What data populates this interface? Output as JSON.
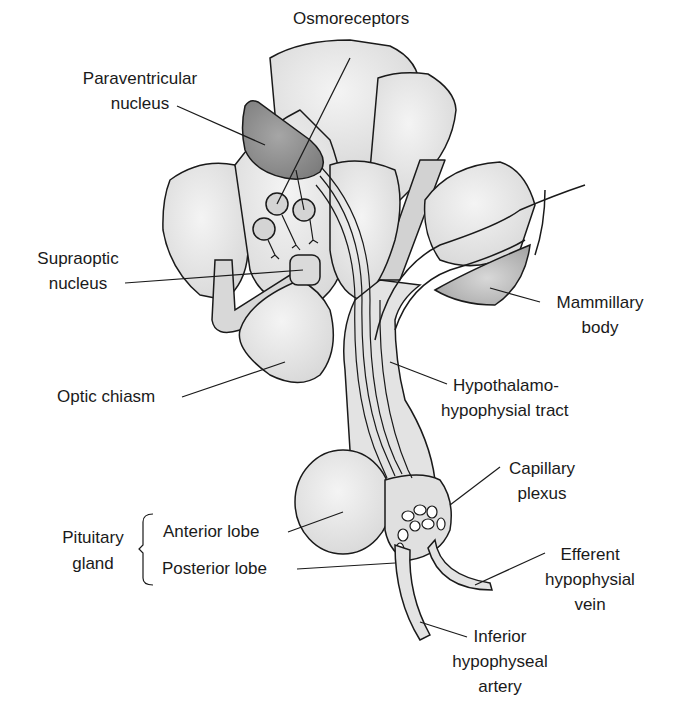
{
  "diagram": {
    "type": "anatomical-illustration",
    "colors": {
      "outline": "#1a1a1a",
      "light_fill": "#e6e6e6",
      "mid_fill": "#cfcfcf",
      "dark_fill": "#8c8c8c",
      "background": "#ffffff"
    },
    "labels": {
      "osmoreceptors": "Osmoreceptors",
      "paraventricular_1": "Paraventricular",
      "paraventricular_2": "nucleus",
      "supraoptic_1": "Supraoptic",
      "supraoptic_2": "nucleus",
      "mammillary_1": "Mammillary",
      "mammillary_2": "body",
      "optic_chiasm": "Optic chiasm",
      "tract_1": "Hypothalamo-",
      "tract_2": "hypophysial tract",
      "capillary_1": "Capillary",
      "capillary_2": "plexus",
      "pituitary_1": "Pituitary",
      "pituitary_2": "gland",
      "anterior_lobe": "Anterior lobe",
      "posterior_lobe": "Posterior lobe",
      "efferent_1": "Efferent",
      "efferent_2": "hypophysial",
      "efferent_3": "vein",
      "inferior_1": "Inferior",
      "inferior_2": "hypophyseal",
      "inferior_3": "artery"
    }
  }
}
